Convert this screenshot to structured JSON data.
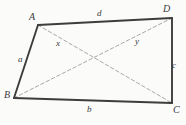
{
  "figure": {
    "kind": "geometry-diagram",
    "shape": "quadrilateral",
    "background_color": "#fbfbfa",
    "side_stroke_color": "#3d3d3d",
    "diagonal_stroke_color": "#a8a8a8",
    "label_color": "#3a3a3a",
    "vertices": [
      {
        "name": "A",
        "label": "A",
        "x": 38,
        "y": 25
      },
      {
        "name": "B",
        "label": "B",
        "x": 14,
        "y": 98
      },
      {
        "name": "C",
        "label": "C",
        "x": 172,
        "y": 103
      },
      {
        "name": "D",
        "label": "D",
        "x": 172,
        "y": 18
      }
    ],
    "sides": [
      {
        "name": "AD",
        "label": "d",
        "from": "A",
        "to": "D",
        "style": "solid"
      },
      {
        "name": "AB",
        "label": "a",
        "from": "A",
        "to": "B",
        "style": "solid"
      },
      {
        "name": "BC",
        "label": "b",
        "from": "B",
        "to": "C",
        "style": "solid"
      },
      {
        "name": "DC",
        "label": "c",
        "from": "D",
        "to": "C",
        "style": "solid"
      }
    ],
    "diagonals": [
      {
        "name": "AC",
        "label": "x",
        "from": "A",
        "to": "C",
        "style": "dashed"
      },
      {
        "name": "BD",
        "label": "y",
        "from": "B",
        "to": "D",
        "style": "dashed"
      }
    ]
  }
}
